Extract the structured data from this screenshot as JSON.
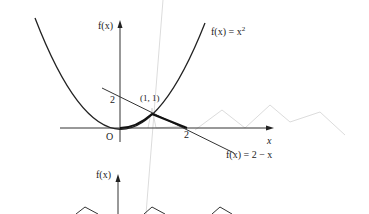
{
  "top_figure": {
    "y_axis_label": "f(x)",
    "x_axis_label": "x",
    "origin_label": "O",
    "y_tick_label": "2",
    "x_tick_label": "2",
    "point_label": "(1, 1)",
    "curve1_label_prefix": "f(x) = x",
    "curve1_label_exp": "2",
    "curve2_label": "f(x) = 2 − x"
  },
  "bottom_figure": {
    "y_axis_label": "f(x)"
  },
  "colors": {
    "ink": "#222222",
    "ghost": "#d8d8d8"
  }
}
